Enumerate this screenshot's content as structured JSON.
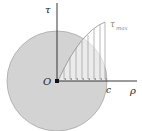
{
  "diagram": {
    "labels": {
      "tau_axis": "τ",
      "rho_axis": "ρ",
      "origin": "O",
      "radius": "c",
      "tau_max": "τ",
      "tau_max_sub": "max"
    },
    "colors": {
      "disk_fill": "#d3d3d3",
      "disk_stroke": "#a8a8a8",
      "axis": "#222222",
      "arrows": "#999999"
    },
    "arrow_positions_x": [
      64,
      70,
      76,
      82,
      88,
      94,
      100,
      105
    ]
  }
}
